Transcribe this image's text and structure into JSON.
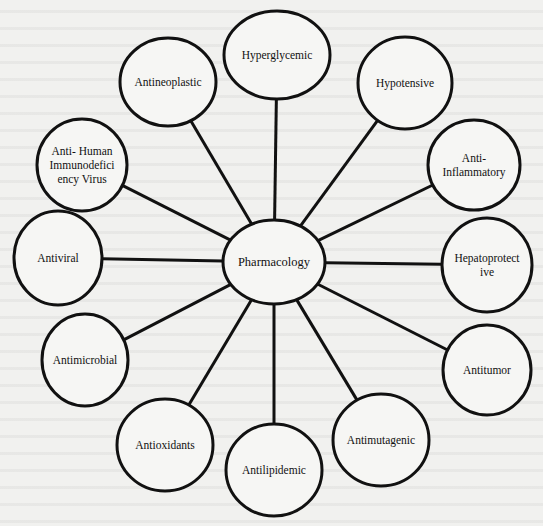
{
  "diagram": {
    "title": "Pharmacology",
    "center": {
      "label": "Pharmacology",
      "cx": 274,
      "cy": 262,
      "rx": 51,
      "ry": 42
    },
    "colors": {
      "stroke": "#111111",
      "fill": "#f6f6f4",
      "background": "#f1f1ef"
    },
    "nodes": [
      {
        "id": "hyperglycemic",
        "label": "Hyperglycemic",
        "cx": 277,
        "cy": 55,
        "rx": 53,
        "ry": 44
      },
      {
        "id": "hypotensive",
        "label": "Hypotensive",
        "cx": 405,
        "cy": 83,
        "rx": 47,
        "ry": 46
      },
      {
        "id": "anti-inflammatory",
        "label": "Anti-\nInflammatory",
        "cx": 474,
        "cy": 165,
        "rx": 46,
        "ry": 45
      },
      {
        "id": "hepatoprotective",
        "label": "Hepatoprotect\nive",
        "cx": 487,
        "cy": 265,
        "rx": 45,
        "ry": 47
      },
      {
        "id": "antitumor",
        "label": "Antitumor",
        "cx": 487,
        "cy": 370,
        "rx": 44,
        "ry": 45
      },
      {
        "id": "antimutagenic",
        "label": "Antimutagenic",
        "cx": 381,
        "cy": 440,
        "rx": 48,
        "ry": 46
      },
      {
        "id": "antilipidemic",
        "label": "Antilipidemic",
        "cx": 274,
        "cy": 470,
        "rx": 48,
        "ry": 46
      },
      {
        "id": "antioxidants",
        "label": "Antioxidants",
        "cx": 165,
        "cy": 445,
        "rx": 48,
        "ry": 46
      },
      {
        "id": "antimicrobial",
        "label": "Antimicrobial",
        "cx": 85,
        "cy": 360,
        "rx": 43,
        "ry": 46
      },
      {
        "id": "antiviral",
        "label": "Antiviral",
        "cx": 58,
        "cy": 258,
        "rx": 44,
        "ry": 47
      },
      {
        "id": "anti-hiv",
        "label": "Anti- Human\nImmunodefici\nency Virus",
        "cx": 82,
        "cy": 165,
        "rx": 45,
        "ry": 46
      },
      {
        "id": "antineoplastic",
        "label": "Antineoplastic",
        "cx": 168,
        "cy": 82,
        "rx": 48,
        "ry": 44
      }
    ]
  }
}
